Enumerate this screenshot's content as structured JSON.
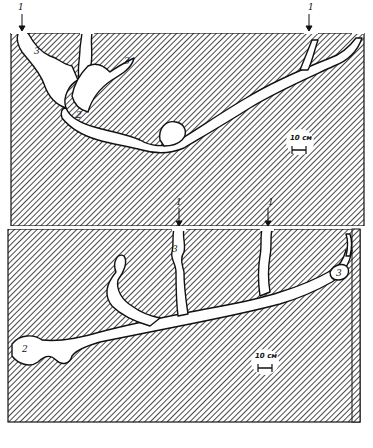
{
  "figure": {
    "type": "burrow cross-section diagram",
    "panels": [
      {
        "id": "top",
        "labels": {
          "entrance_left": "1",
          "entrance_right": "1",
          "chamber": "2",
          "side_left": "3",
          "side_mid": "3"
        },
        "scale_bar": "10 см"
      },
      {
        "id": "bottom",
        "labels": {
          "entrance_left": "1",
          "entrance_right": "1",
          "chamber": "2",
          "side_mid": "3",
          "side_right": "3"
        },
        "scale_bar": "10 см"
      }
    ],
    "colors": {
      "hatch": "#1a1a1a",
      "background": "#ffffff",
      "outline": "#111111"
    }
  }
}
